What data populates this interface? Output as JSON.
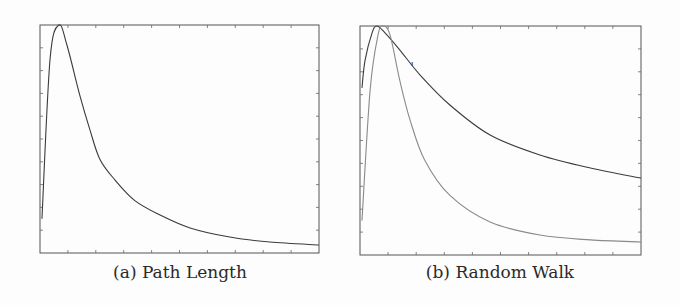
{
  "chart_data": [
    {
      "type": "line",
      "caption": "(a) Path Length",
      "xlabel": "",
      "ylabel": "",
      "xlim": [
        0,
        10
      ],
      "ylim": [
        0,
        10
      ],
      "x_ticks": 10,
      "y_ticks": 10,
      "tick_labels_shown": false,
      "grid": false,
      "series": [
        {
          "name": "path-length",
          "color": "#3a3a3a",
          "x": [
            0.07,
            0.36,
            0.68,
            0.97,
            1.43,
            1.79,
            2.15,
            2.69,
            3.4,
            4.3,
            5.38,
            6.8,
            8.24,
            10
          ],
          "y": [
            1.5,
            8.5,
            10,
            9.1,
            6.9,
            5.4,
            4.1,
            3.2,
            2.3,
            1.67,
            1.1,
            0.7,
            0.48,
            0.35
          ]
        }
      ]
    },
    {
      "type": "line",
      "caption": "(b) Random Walk",
      "xlabel": "",
      "ylabel": "",
      "xlim": [
        0,
        10
      ],
      "ylim": [
        0,
        10
      ],
      "x_ticks": 10,
      "y_ticks": 10,
      "tick_labels_shown": false,
      "grid": false,
      "series": [
        {
          "name": "random-walk-upper",
          "color": "#3a3a3a",
          "x": [
            0.07,
            0.18,
            0.43,
            0.6,
            0.89,
            1.42,
            2.14,
            3.2,
            4.63,
            6.4,
            8.2,
            10
          ],
          "y": [
            7.3,
            8.5,
            9.7,
            10,
            9.7,
            8.95,
            7.86,
            6.55,
            5.24,
            4.37,
            3.8,
            3.36
          ]
        },
        {
          "name": "random-walk-lower",
          "color": "#8a8a8a",
          "x": [
            0.07,
            0.36,
            0.64,
            0.82,
            1.07,
            1.42,
            1.78,
            2.3,
            3.2,
            4.63,
            6.4,
            8.2,
            10
          ],
          "y": [
            1.5,
            7.2,
            9.6,
            10,
            9.6,
            7.6,
            5.9,
            4.15,
            2.6,
            1.44,
            0.87,
            0.66,
            0.57
          ]
        }
      ],
      "annotations": [
        {
          "text": "'",
          "x": 1.8,
          "y": 8.0
        }
      ]
    }
  ]
}
